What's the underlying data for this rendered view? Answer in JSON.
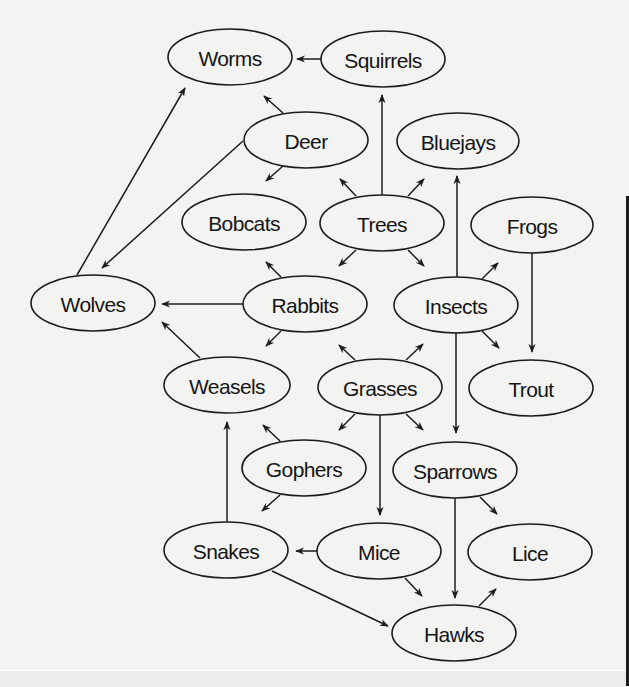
{
  "diagram": {
    "type": "food-web",
    "colors": {
      "background": "#f3f3f1",
      "stroke": "#1c1c1c",
      "text": "#151515"
    },
    "nodes": [
      {
        "id": "worms",
        "label": "Worms",
        "cx": 230,
        "cy": 57,
        "rx": 62,
        "ry": 28
      },
      {
        "id": "squirrels",
        "label": "Squirrels",
        "cx": 383,
        "cy": 59,
        "rx": 62,
        "ry": 28
      },
      {
        "id": "deer",
        "label": "Deer",
        "cx": 306,
        "cy": 140,
        "rx": 62,
        "ry": 28
      },
      {
        "id": "bluejays",
        "label": "Bluejays",
        "cx": 458,
        "cy": 141,
        "rx": 61,
        "ry": 28
      },
      {
        "id": "bobcats",
        "label": "Bobcats",
        "cx": 244,
        "cy": 222,
        "rx": 62,
        "ry": 28
      },
      {
        "id": "trees",
        "label": "Trees",
        "cx": 382,
        "cy": 223,
        "rx": 62,
        "ry": 28
      },
      {
        "id": "frogs",
        "label": "Frogs",
        "cx": 532,
        "cy": 225,
        "rx": 61,
        "ry": 28
      },
      {
        "id": "wolves",
        "label": "Wolves",
        "cx": 93,
        "cy": 303,
        "rx": 62,
        "ry": 28
      },
      {
        "id": "rabbits",
        "label": "Rabbits",
        "cx": 305,
        "cy": 304,
        "rx": 62,
        "ry": 28
      },
      {
        "id": "insects",
        "label": "Insects",
        "cx": 456,
        "cy": 305,
        "rx": 62,
        "ry": 28
      },
      {
        "id": "weasels",
        "label": "Weasels",
        "cx": 227,
        "cy": 385,
        "rx": 63,
        "ry": 28
      },
      {
        "id": "grasses",
        "label": "Grasses",
        "cx": 380,
        "cy": 387,
        "rx": 62,
        "ry": 28
      },
      {
        "id": "trout",
        "label": "Trout",
        "cx": 531,
        "cy": 388,
        "rx": 62,
        "ry": 28
      },
      {
        "id": "gophers",
        "label": "Gophers",
        "cx": 304,
        "cy": 468,
        "rx": 62,
        "ry": 28
      },
      {
        "id": "sparrows",
        "label": "Sparrows",
        "cx": 455,
        "cy": 470,
        "rx": 62,
        "ry": 28
      },
      {
        "id": "snakes",
        "label": "Snakes",
        "cx": 226,
        "cy": 550,
        "rx": 62,
        "ry": 28
      },
      {
        "id": "mice",
        "label": "Mice",
        "cx": 379,
        "cy": 551,
        "rx": 62,
        "ry": 28
      },
      {
        "id": "lice",
        "label": "Lice",
        "cx": 530,
        "cy": 552,
        "rx": 62,
        "ry": 28
      },
      {
        "id": "hawks",
        "label": "Hawks",
        "cx": 454,
        "cy": 633,
        "rx": 62,
        "ry": 28
      }
    ],
    "edges": [
      {
        "from": "squirrels",
        "to": "worms",
        "x1": 322,
        "y1": 59,
        "x2": 297,
        "y2": 59
      },
      {
        "from": "deer",
        "to": "worms",
        "x1": 283,
        "y1": 113,
        "x2": 264,
        "y2": 96
      },
      {
        "from": "wolves",
        "to": "worms",
        "x1": 77,
        "y1": 275,
        "x2": 185,
        "y2": 88
      },
      {
        "from": "deer",
        "to": "wolves",
        "x1": 243,
        "y1": 141,
        "x2": 102,
        "y2": 268
      },
      {
        "from": "deer",
        "to": "bobcats",
        "x1": 283,
        "y1": 166,
        "x2": 266,
        "y2": 181
      },
      {
        "from": "trees",
        "to": "squirrels",
        "x1": 382,
        "y1": 195,
        "x2": 382,
        "y2": 95
      },
      {
        "from": "trees",
        "to": "deer",
        "x1": 356,
        "y1": 196,
        "x2": 340,
        "y2": 179
      },
      {
        "from": "trees",
        "to": "bluejays",
        "x1": 408,
        "y1": 196,
        "x2": 424,
        "y2": 179
      },
      {
        "from": "trees",
        "to": "rabbits",
        "x1": 356,
        "y1": 250,
        "x2": 339,
        "y2": 266
      },
      {
        "from": "trees",
        "to": "insects",
        "x1": 408,
        "y1": 250,
        "x2": 424,
        "y2": 266
      },
      {
        "from": "insects",
        "to": "bluejays",
        "x1": 457,
        "y1": 277,
        "x2": 457,
        "y2": 176
      },
      {
        "from": "insects",
        "to": "frogs",
        "x1": 482,
        "y1": 279,
        "x2": 498,
        "y2": 263
      },
      {
        "from": "frogs",
        "to": "trout",
        "x1": 532,
        "y1": 253,
        "x2": 532,
        "y2": 352
      },
      {
        "from": "insects",
        "to": "trout",
        "x1": 482,
        "y1": 331,
        "x2": 499,
        "y2": 348
      },
      {
        "from": "insects",
        "to": "sparrows",
        "x1": 456,
        "y1": 333,
        "x2": 456,
        "y2": 433
      },
      {
        "from": "rabbits",
        "to": "bobcats",
        "x1": 281,
        "y1": 277,
        "x2": 266,
        "y2": 262
      },
      {
        "from": "rabbits",
        "to": "wolves",
        "x1": 243,
        "y1": 304,
        "x2": 162,
        "y2": 304
      },
      {
        "from": "rabbits",
        "to": "weasels",
        "x1": 281,
        "y1": 331,
        "x2": 266,
        "y2": 346
      },
      {
        "from": "weasels",
        "to": "wolves",
        "x1": 200,
        "y1": 358,
        "x2": 162,
        "y2": 322
      },
      {
        "from": "grasses",
        "to": "rabbits",
        "x1": 355,
        "y1": 360,
        "x2": 339,
        "y2": 345
      },
      {
        "from": "grasses",
        "to": "insects",
        "x1": 406,
        "y1": 360,
        "x2": 423,
        "y2": 344
      },
      {
        "from": "grasses",
        "to": "gophers",
        "x1": 355,
        "y1": 414,
        "x2": 339,
        "y2": 430
      },
      {
        "from": "grasses",
        "to": "sparrows",
        "x1": 406,
        "y1": 414,
        "x2": 423,
        "y2": 430
      },
      {
        "from": "grasses",
        "to": "mice",
        "x1": 380,
        "y1": 415,
        "x2": 380,
        "y2": 515
      },
      {
        "from": "gophers",
        "to": "weasels",
        "x1": 280,
        "y1": 441,
        "x2": 263,
        "y2": 425
      },
      {
        "from": "gophers",
        "to": "snakes",
        "x1": 280,
        "y1": 495,
        "x2": 262,
        "y2": 511
      },
      {
        "from": "snakes",
        "to": "weasels",
        "x1": 227,
        "y1": 522,
        "x2": 227,
        "y2": 422
      },
      {
        "from": "mice",
        "to": "snakes",
        "x1": 317,
        "y1": 551,
        "x2": 296,
        "y2": 551
      },
      {
        "from": "mice",
        "to": "hawks",
        "x1": 405,
        "y1": 578,
        "x2": 422,
        "y2": 596
      },
      {
        "from": "snakes",
        "to": "hawks",
        "x1": 272,
        "y1": 571,
        "x2": 388,
        "y2": 626
      },
      {
        "from": "sparrows",
        "to": "hawks",
        "x1": 455,
        "y1": 498,
        "x2": 455,
        "y2": 598
      },
      {
        "from": "sparrows",
        "to": "lice",
        "x1": 480,
        "y1": 497,
        "x2": 497,
        "y2": 514
      },
      {
        "from": "hawks",
        "to": "lice",
        "x1": 479,
        "y1": 606,
        "x2": 496,
        "y2": 589
      }
    ]
  }
}
